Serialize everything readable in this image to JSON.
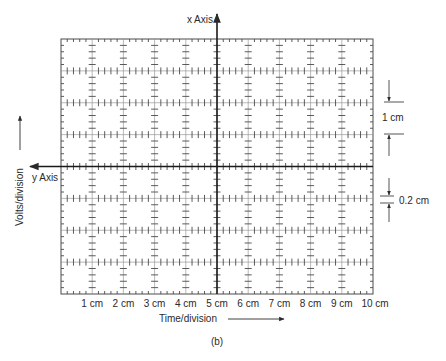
{
  "figure": {
    "caption": "(b)",
    "grid": {
      "columns": 10,
      "rows": 8,
      "subdivisions": 5,
      "left": 61,
      "right": 373,
      "top": 39,
      "bottom": 294,
      "center_col": 5,
      "center_row": 4
    },
    "axes": {
      "vertical_label": "x Axis",
      "horizontal_label": "y Axis"
    },
    "x_tick_labels": [
      "1 cm",
      "2 cm",
      "3 cm",
      "4 cm",
      "5 cm",
      "6 cm",
      "7 cm",
      "8 cm",
      "9 cm",
      "10 cm"
    ],
    "x_axis_title": "Time/division",
    "y_axis_title": "Volts/division",
    "annotations": {
      "major_division": "1 cm",
      "minor_division": "0.2 cm"
    },
    "colors": {
      "ink": "#2a2a2a",
      "grid": "#4a4a4a",
      "background": "#ffffff"
    }
  }
}
